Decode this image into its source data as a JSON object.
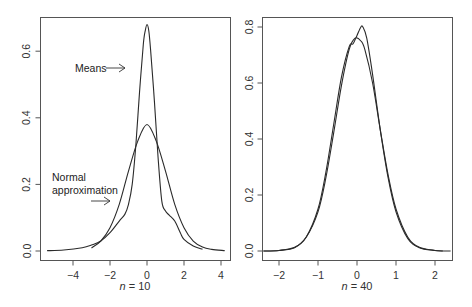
{
  "chart_data": [
    {
      "type": "line",
      "title": "",
      "xlabel": "n = 10",
      "xlabel_italic_part": "n",
      "xlabel_rest": " = 10",
      "ylabel": "",
      "xlim": [
        -5.7,
        4.5
      ],
      "ylim": [
        -0.03,
        0.7
      ],
      "xticks": [
        -4,
        -2,
        0,
        2,
        4
      ],
      "xtick_labels": [
        "−4",
        "−2",
        "0",
        "2",
        "4"
      ],
      "yticks": [
        0.0,
        0.2,
        0.4,
        0.6
      ],
      "ytick_labels": [
        "0.0",
        "0.2",
        "0.4",
        "0.6"
      ],
      "grid": false,
      "annotations": [
        {
          "text": [
            "Means"
          ],
          "arrow": "right",
          "points_to": "Means"
        },
        {
          "text": [
            "Normal",
            "approximation"
          ],
          "arrow": "right",
          "points_to": "Normal approximation"
        }
      ],
      "series": [
        {
          "name": "Means",
          "x": [
            -5.4,
            -4.5,
            -3.5,
            -3.0,
            -2.5,
            -2.0,
            -1.5,
            -1.2,
            -1.0,
            -0.8,
            -0.6,
            -0.4,
            -0.2,
            -0.1,
            0.0,
            0.1,
            0.2,
            0.4,
            0.6,
            0.8,
            1.0,
            1.2,
            1.5,
            1.8,
            2.0,
            2.5,
            3.0
          ],
          "y": [
            0.001,
            0.003,
            0.01,
            0.018,
            0.03,
            0.055,
            0.09,
            0.11,
            0.14,
            0.2,
            0.32,
            0.48,
            0.62,
            0.66,
            0.68,
            0.66,
            0.6,
            0.45,
            0.28,
            0.15,
            0.12,
            0.108,
            0.09,
            0.055,
            0.035,
            0.015,
            0.005
          ]
        },
        {
          "name": "Normal approximation",
          "x": [
            -3.0,
            -2.5,
            -2.0,
            -1.5,
            -1.0,
            -0.5,
            0.0,
            0.5,
            1.0,
            1.5,
            2.0,
            2.5,
            3.0,
            3.5,
            4.2
          ],
          "y": [
            0.009,
            0.03,
            0.07,
            0.14,
            0.24,
            0.33,
            0.38,
            0.33,
            0.24,
            0.14,
            0.07,
            0.03,
            0.012,
            0.005,
            0.001
          ]
        }
      ]
    },
    {
      "type": "line",
      "title": "",
      "xlabel": "n = 40",
      "xlabel_italic_part": "n",
      "xlabel_rest": " = 40",
      "ylabel": "",
      "xlim": [
        -2.4,
        2.4
      ],
      "ylim": [
        -0.02,
        0.82
      ],
      "xticks": [
        -2,
        -1,
        0,
        1,
        2
      ],
      "xtick_labels": [
        "−2",
        "−1",
        "0",
        "1",
        "2"
      ],
      "yticks": [
        0.0,
        0.2,
        0.4,
        0.6,
        0.8
      ],
      "ytick_labels": [
        "0.0",
        "0.2",
        "0.4",
        "0.6",
        "0.8"
      ],
      "grid": false,
      "series": [
        {
          "name": "Means",
          "x": [
            -2.4,
            -2.0,
            -1.6,
            -1.3,
            -1.0,
            -0.8,
            -0.6,
            -0.4,
            -0.2,
            -0.1,
            0.0,
            0.1,
            0.15,
            0.25,
            0.4,
            0.6,
            0.8,
            1.0,
            1.3,
            1.6,
            2.0,
            2.2
          ],
          "y": [
            0.0,
            0.002,
            0.012,
            0.05,
            0.15,
            0.28,
            0.45,
            0.62,
            0.73,
            0.74,
            0.77,
            0.8,
            0.8,
            0.76,
            0.63,
            0.43,
            0.26,
            0.14,
            0.045,
            0.012,
            0.002,
            0.0
          ]
        },
        {
          "name": "Normal approximation",
          "x": [
            -2.4,
            -2.0,
            -1.6,
            -1.3,
            -1.0,
            -0.8,
            -0.6,
            -0.4,
            -0.2,
            -0.05,
            0.1,
            0.2,
            0.4,
            0.6,
            0.8,
            1.0,
            1.3,
            1.6,
            2.0,
            2.4
          ],
          "y": [
            0.0,
            0.002,
            0.013,
            0.05,
            0.14,
            0.26,
            0.42,
            0.59,
            0.72,
            0.76,
            0.75,
            0.72,
            0.6,
            0.43,
            0.27,
            0.15,
            0.05,
            0.013,
            0.002,
            0.0
          ]
        }
      ]
    }
  ]
}
